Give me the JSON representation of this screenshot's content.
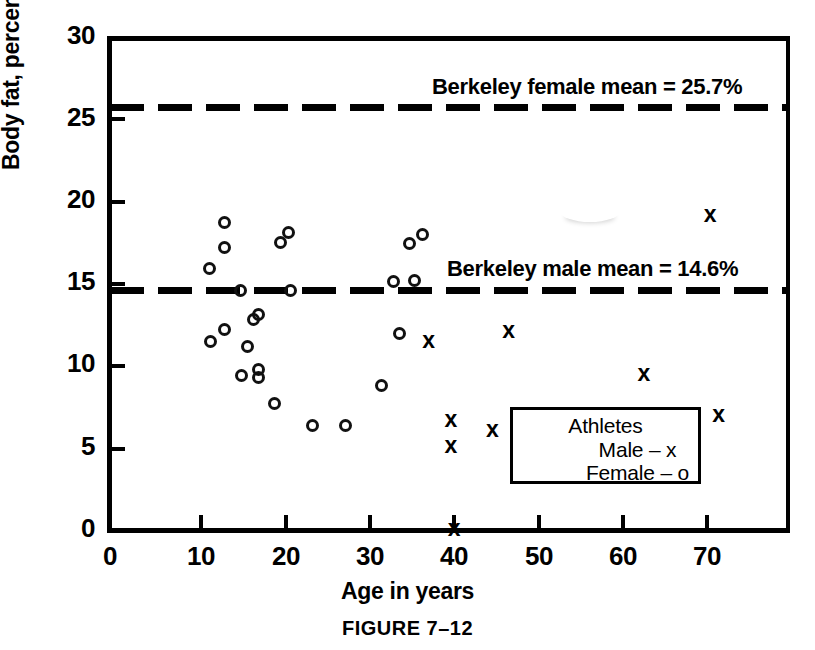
{
  "figure": {
    "caption": "FIGURE 7–12"
  },
  "chart_data": {
    "type": "scatter",
    "title": "",
    "xlabel": "Age in years",
    "ylabel": "Body fat, percent",
    "xlim": [
      0,
      80.5
    ],
    "ylim": [
      0,
      30
    ],
    "xticks": [
      0,
      10,
      20,
      30,
      40,
      50,
      60,
      70
    ],
    "yticks": [
      0,
      5,
      10,
      15,
      20,
      25,
      30
    ],
    "grid": false,
    "legend_position": "inside-lower-right",
    "legend": {
      "title": "Athletes",
      "entries": [
        {
          "label": "Male – x",
          "marker": "x"
        },
        {
          "label": "Female – o",
          "marker": "o"
        }
      ]
    },
    "reference_lines": [
      {
        "name": "berkeley-female-mean",
        "label": "Berkeley female mean = 25.7%",
        "value": 25.7,
        "style": "dashed",
        "orientation": "horizontal"
      },
      {
        "name": "berkeley-male-mean",
        "label": "Berkeley male mean = 14.6%",
        "value": 14.6,
        "style": "dashed",
        "orientation": "horizontal"
      }
    ],
    "series": [
      {
        "name": "Female",
        "marker": "o",
        "points": [
          [
            13.5,
            18.7
          ],
          [
            13.5,
            17.2
          ],
          [
            11.7,
            15.9
          ],
          [
            15.4,
            14.6
          ],
          [
            21.0,
            18.1
          ],
          [
            20.0,
            17.5
          ],
          [
            21.2,
            14.6
          ],
          [
            17.5,
            13.1
          ],
          [
            16.9,
            12.8
          ],
          [
            16.2,
            11.2
          ],
          [
            13.5,
            12.2
          ],
          [
            11.8,
            11.5
          ],
          [
            15.5,
            9.4
          ],
          [
            17.5,
            9.8
          ],
          [
            17.5,
            9.3
          ],
          [
            19.4,
            7.7
          ],
          [
            23.8,
            6.4
          ],
          [
            27.7,
            6.4
          ],
          [
            31.9,
            8.8
          ],
          [
            34.0,
            12.0
          ],
          [
            33.4,
            15.1
          ],
          [
            35.8,
            15.2
          ],
          [
            35.2,
            17.4
          ],
          [
            36.8,
            18.0
          ]
        ]
      },
      {
        "name": "Male",
        "marker": "x",
        "points": [
          [
            37.5,
            11.6
          ],
          [
            46.9,
            12.2
          ],
          [
            62.8,
            9.6
          ],
          [
            40.1,
            6.8
          ],
          [
            45.0,
            6.2
          ],
          [
            40.1,
            5.2
          ],
          [
            40.5,
            0.2
          ],
          [
            71.6,
            7.1
          ],
          [
            70.6,
            19.2
          ]
        ]
      }
    ]
  },
  "axes": {
    "y_tick_labels": [
      "0",
      "5",
      "10",
      "15",
      "20",
      "25",
      "30"
    ],
    "x_tick_labels": [
      "0",
      "10",
      "20",
      "30",
      "40",
      "50",
      "60",
      "70"
    ]
  }
}
